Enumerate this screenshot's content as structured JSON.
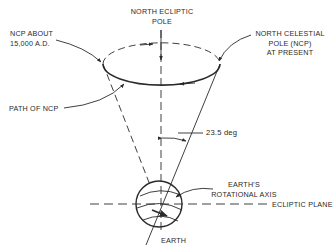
{
  "diagram": {
    "labels": {
      "north_ecliptic_pole": [
        "NORTH ECLIPTIC",
        "POLE"
      ],
      "ncp_future": [
        "NCP ABOUT",
        "15,000 A.D."
      ],
      "ncp_present": [
        "NORTH CELESTIAL",
        "POLE (NCP)",
        "AT PRESENT"
      ],
      "path_of_ncp": "PATH OF NCP",
      "tilt_angle": "23.5 deg",
      "rotational_axis": [
        "EARTH'S",
        "ROTATIONAL AXIS"
      ],
      "ecliptic_plane": "ECLIPTIC PLANE",
      "earth": "EARTH"
    },
    "colors": {
      "ink": "#2a2a2a",
      "background": "#ffffff"
    }
  }
}
